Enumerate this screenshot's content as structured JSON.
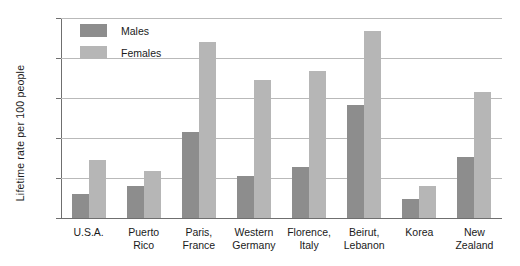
{
  "chart_data": {
    "type": "bar",
    "title": "",
    "xlabel": "",
    "ylabel": "Lifetime rate per 100 people",
    "ylim": [
      0,
      25
    ],
    "yticks": [
      0,
      5,
      10,
      15,
      20,
      25
    ],
    "grid": true,
    "legend_position": "top-left",
    "categories": [
      "U.S.A.",
      "Puerto Rico",
      "Paris, France",
      "Western Germany",
      "Florence, Italy",
      "Beirut, Lebanon",
      "Korea",
      "New Zealand"
    ],
    "category_lines": [
      [
        "U.S.A."
      ],
      [
        "Puerto",
        "Rico"
      ],
      [
        "Paris,",
        "France"
      ],
      [
        "Western",
        "Germany"
      ],
      [
        "Florence,",
        "Italy"
      ],
      [
        "Beirut,",
        "Lebanon"
      ],
      [
        "Korea"
      ],
      [
        "New",
        "Zealand"
      ]
    ],
    "series": [
      {
        "name": "Males",
        "color": "#8d8d8d",
        "values": [
          3.0,
          4.0,
          10.8,
          5.2,
          6.4,
          14.1,
          2.4,
          7.6
        ]
      },
      {
        "name": "Females",
        "color": "#b6b6b6",
        "values": [
          7.3,
          5.9,
          22.0,
          17.2,
          18.4,
          23.4,
          4.0,
          15.8
        ]
      }
    ]
  },
  "legend": {
    "items": [
      {
        "label": "Males",
        "swatch": "males-swatch"
      },
      {
        "label": "Females",
        "swatch": "females-swatch"
      }
    ]
  },
  "axes": {
    "y_title": "Lifetime rate per 100 people",
    "y_tick_labels": [
      "25",
      "20",
      "15",
      "10",
      "5",
      "0"
    ]
  }
}
